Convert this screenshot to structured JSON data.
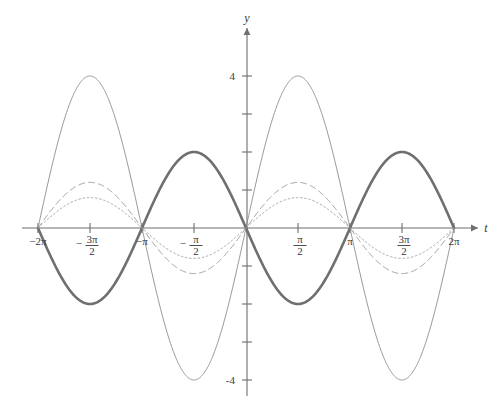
{
  "figure": {
    "axis_x_label": "t",
    "axis_y_label": "y",
    "background": "#ffffff",
    "axis_color": "#6e6e6e"
  },
  "chart_data": {
    "type": "line",
    "title": "",
    "xlabel": "t",
    "ylabel": "y",
    "xlim": [
      -6.283185307179586,
      6.283185307179586
    ],
    "ylim": [
      -4.6,
      4.6
    ],
    "grid": false,
    "legend": "none",
    "x_tick_values": [
      -6.283185307,
      -4.71238898,
      -3.141592653,
      -1.570796327,
      1.570796327,
      3.141592653,
      4.71238898,
      6.283185307
    ],
    "x_tick_labels": [
      "-2π",
      "-3π/2",
      "-π",
      "-π/2",
      "π/2",
      "π",
      "3π/2",
      "2π"
    ],
    "x_tick_label_parts": [
      {
        "kind": "plain",
        "text": "−2π"
      },
      {
        "kind": "fraction",
        "sign": "−",
        "numerator": "3π",
        "denominator": "2"
      },
      {
        "kind": "plain",
        "text": "−π"
      },
      {
        "kind": "fraction",
        "sign": "−",
        "numerator": "π",
        "denominator": "2"
      },
      {
        "kind": "fraction",
        "sign": "",
        "numerator": "π",
        "denominator": "2"
      },
      {
        "kind": "plain",
        "text": "π"
      },
      {
        "kind": "fraction",
        "sign": "",
        "numerator": "3π",
        "denominator": "2"
      },
      {
        "kind": "plain",
        "text": "2π"
      }
    ],
    "y_tick_values": [
      -4,
      -3,
      -2,
      -1,
      1,
      2,
      3,
      4
    ],
    "y_tick_labels_shown": [
      "4",
      "-4"
    ],
    "y_labeled_values": [
      4,
      -4
    ],
    "series": [
      {
        "name": "amplitude-4-thin-solid",
        "style": "solid",
        "linewidth": 0.9,
        "color": "#8a8a8a",
        "amplitude": 4,
        "phase": "sin",
        "formula": "y = 4 sin(t)",
        "peaks": [
          {
            "t": -4.71238898,
            "y": 4
          },
          {
            "t": 1.570796327,
            "y": 4
          }
        ],
        "troughs": [
          {
            "t": -1.570796327,
            "y": -4
          },
          {
            "t": 4.71238898,
            "y": -4
          }
        ]
      },
      {
        "name": "amplitude-2-thick-solid",
        "style": "solid",
        "linewidth": 2.6,
        "color": "#6f6f6f",
        "amplitude": 2,
        "phase": "-sin",
        "formula": "y = -2 sin(t)",
        "peaks": [
          {
            "t": -1.570796327,
            "y": 2
          },
          {
            "t": 4.71238898,
            "y": 2
          }
        ],
        "troughs": [
          {
            "t": -4.71238898,
            "y": -2
          },
          {
            "t": 1.570796327,
            "y": -2
          }
        ]
      },
      {
        "name": "amplitude-1p2-dashed",
        "style": "dashed",
        "linewidth": 1.0,
        "color": "#9a9a9a",
        "amplitude": 1.2,
        "phase": "sin",
        "formula": "y = 1.2 sin(t)",
        "peaks": [
          {
            "t": -4.71238898,
            "y": 1.2
          },
          {
            "t": 1.570796327,
            "y": 1.2
          }
        ],
        "troughs": [
          {
            "t": -1.570796327,
            "y": -1.2
          },
          {
            "t": 4.71238898,
            "y": -1.2
          }
        ]
      },
      {
        "name": "amplitude-0p8-dotted",
        "style": "dotted",
        "linewidth": 1.0,
        "color": "#a2a2a2",
        "amplitude": 0.8,
        "phase": "sin",
        "formula": "y = 0.8 sin(t)",
        "peaks": [
          {
            "t": -4.71238898,
            "y": 0.8
          },
          {
            "t": 1.570796327,
            "y": 0.8
          }
        ],
        "troughs": [
          {
            "t": -1.570796327,
            "y": -0.8
          },
          {
            "t": 4.71238898,
            "y": -0.8
          }
        ]
      }
    ]
  },
  "geometry": {
    "origin_x": 246,
    "origin_y": 228,
    "px_per_unit_y": 38,
    "px_per_half_pi": 52,
    "x_axis_left": 22,
    "x_axis_right": 478,
    "y_axis_top": 28,
    "y_axis_bottom": 396
  }
}
